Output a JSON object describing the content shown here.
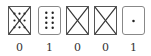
{
  "cards": [
    {
      "label": "0",
      "dots": 9,
      "crossed": true,
      "rounded": false
    },
    {
      "label": "1",
      "dots": 8,
      "crossed": false,
      "rounded": true
    },
    {
      "label": "0",
      "dots": 0,
      "crossed": true,
      "rounded": false
    },
    {
      "label": "0",
      "dots": 0,
      "crossed": true,
      "rounded": false
    },
    {
      "label": "1",
      "dots": 1,
      "crossed": false,
      "rounded": true
    }
  ],
  "colors": {
    "stroke": "#333333",
    "dot": "#222222"
  }
}
